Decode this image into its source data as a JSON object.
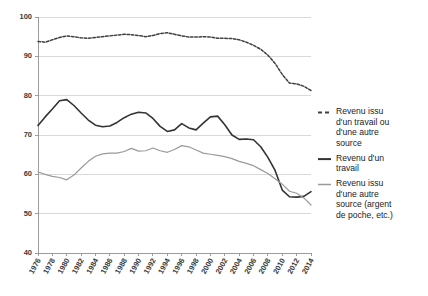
{
  "chart_data": {
    "type": "line",
    "title": "",
    "subtitle": "",
    "xlabel": "",
    "ylabel": "",
    "ylim": [
      40,
      100
    ],
    "yticks": [
      40,
      50,
      60,
      70,
      80,
      90,
      100
    ],
    "ytick_labels": [
      "40",
      "50",
      "60",
      "70",
      "80",
      "90",
      "100"
    ],
    "grid": true,
    "legend_position": "right",
    "x": [
      1976,
      1977,
      1978,
      1979,
      1980,
      1981,
      1982,
      1983,
      1984,
      1985,
      1986,
      1987,
      1988,
      1989,
      1990,
      1991,
      1992,
      1993,
      1994,
      1995,
      1996,
      1997,
      1998,
      1999,
      2000,
      2001,
      2002,
      2003,
      2004,
      2005,
      2006,
      2007,
      2008,
      2009,
      2010,
      2011,
      2012,
      2013,
      2014
    ],
    "xtick_labels": [
      "1976",
      "1978",
      "1980",
      "1982",
      "1984",
      "1986",
      "1988",
      "1990",
      "1992",
      "1994",
      "1996",
      "1998",
      "2000",
      "2002",
      "2004",
      "2006",
      "2008",
      "2010",
      "2012",
      "2014"
    ],
    "xticks": [
      1976,
      1978,
      1980,
      1982,
      1984,
      1986,
      1988,
      1990,
      1992,
      1994,
      1996,
      1998,
      2000,
      2002,
      2004,
      2006,
      2008,
      2010,
      2012,
      2014
    ],
    "series": [
      {
        "name": "Revenu issu d'un travail ou d'une autre source",
        "style": "dashed",
        "color": "#404040",
        "values": [
          93.8,
          93.6,
          94.2,
          94.8,
          95.2,
          95.0,
          94.7,
          94.6,
          94.8,
          95.0,
          95.2,
          95.4,
          95.6,
          95.5,
          95.3,
          95.0,
          95.3,
          95.8,
          96.0,
          95.6,
          95.2,
          94.9,
          94.9,
          95.0,
          94.9,
          94.6,
          94.6,
          94.5,
          94.2,
          93.6,
          92.8,
          91.8,
          90.3,
          88.2,
          85.4,
          83.2,
          83.0,
          82.4,
          81.3
        ]
      },
      {
        "name": "Revenu d'un travail",
        "style": "solid",
        "color": "#333333",
        "values": [
          72.4,
          74.6,
          76.6,
          78.7,
          79.0,
          77.5,
          75.6,
          73.8,
          72.5,
          72.1,
          72.3,
          73.2,
          74.4,
          75.3,
          75.8,
          75.6,
          74.2,
          72.2,
          70.9,
          71.3,
          72.9,
          71.8,
          71.3,
          73.0,
          74.6,
          74.8,
          72.6,
          70.0,
          68.9,
          69.0,
          68.8,
          67.0,
          64.3,
          61.0,
          56.0,
          54.3,
          54.2,
          54.4,
          55.6
        ]
      },
      {
        "name": "Revenu issu d'une autre source (argent de poche, etc.)",
        "style": "solid",
        "color": "#9a9a9a",
        "values": [
          60.6,
          60.0,
          59.5,
          59.2,
          58.6,
          59.8,
          61.6,
          63.3,
          64.6,
          65.2,
          65.4,
          65.4,
          65.8,
          66.6,
          65.9,
          66.0,
          66.7,
          66.0,
          65.6,
          66.3,
          67.3,
          67.0,
          66.2,
          65.4,
          65.1,
          64.8,
          64.5,
          64.0,
          63.3,
          62.8,
          62.2,
          61.2,
          60.2,
          58.9,
          57.5,
          55.7,
          55.2,
          54.0,
          52.2
        ]
      }
    ]
  },
  "legend": {
    "entries": [
      {
        "label": "Revenu issu d'un travail ou d'une autre source",
        "style": "dashed",
        "color": "#404040"
      },
      {
        "label": "Revenu d'un travail",
        "style": "solid",
        "color": "#333333"
      },
      {
        "label": "Revenu issu d'une autre source (argent de poche, etc.)",
        "style": "solid",
        "color": "#9a9a9a"
      }
    ]
  }
}
